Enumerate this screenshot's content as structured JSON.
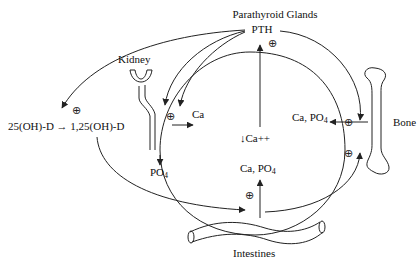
{
  "diagram": {
    "nodes": {
      "parathyroid": {
        "label": "Parathyroid Glands",
        "hormone": "PTH"
      },
      "kidney": {
        "label": "Kidney",
        "outputs": {
          "ca": "Ca",
          "po4": "PO",
          "po4_sub": "4"
        }
      },
      "vitamin_d": {
        "substrate": "25(OH)-D",
        "arrow": "→",
        "product": "1,25(OH)-D"
      },
      "center": {
        "label": "↓Ca++"
      },
      "bone": {
        "label": "Bone",
        "output": "Ca, PO",
        "output_sub": "4"
      },
      "intestines": {
        "label": "Intestines",
        "output": "Ca, PO",
        "output_sub": "4"
      }
    },
    "stimulation_symbol": "⊕",
    "edges": [
      {
        "from": "↓Ca++",
        "to": "PTH",
        "sign": "+"
      },
      {
        "from": "PTH",
        "to": "Kidney",
        "sign": "+"
      },
      {
        "from": "PTH",
        "to": "25(OH)-D → 1,25(OH)-D",
        "sign": "+"
      },
      {
        "from": "PTH",
        "to": "Bone",
        "sign": "+"
      },
      {
        "from": "1,25(OH)-D",
        "to": "Intestines",
        "sign": "+"
      },
      {
        "from": "1,25(OH)-D",
        "to": "Bone",
        "sign": "+"
      },
      {
        "from": "Kidney",
        "to": "Ca (blood)"
      },
      {
        "from": "Kidney",
        "to": "PO4 (urine)"
      },
      {
        "from": "Bone",
        "to": "Ca, PO4 (blood)"
      },
      {
        "from": "Intestines",
        "to": "Ca, PO4 (blood)"
      }
    ]
  }
}
